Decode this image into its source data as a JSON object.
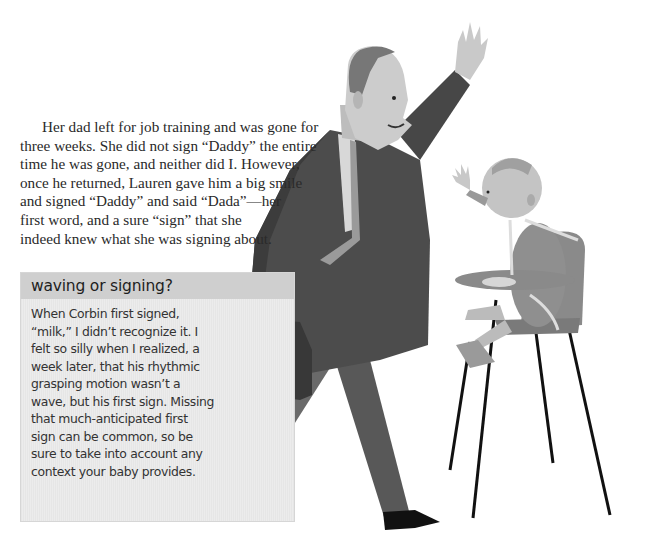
{
  "article": {
    "paragraph_lines": [
      "Her dad left for job training and was gone for",
      "three weeks. She did not sign “Daddy” the entire",
      "time he was gone, and neither did I. However,",
      "once he returned, Lauren gave him a big smile",
      "and signed “Daddy” and said “Dada”—her",
      "first word, and a sure “sign” that she",
      "indeed knew what she was signing about."
    ]
  },
  "sidebar": {
    "title": "waving or signing?",
    "body_lines": [
      "When Corbin first signed,",
      "“milk,” I didn’t recognize it. I",
      "felt so silly when I realized, a",
      "week later, that his rhythmic",
      "grasping motion wasn’t a",
      "wave, but his first sign. Missing",
      "that much-anticipated first",
      "sign can be common, so be",
      "sure to take into account any",
      "context your baby provides."
    ]
  },
  "illustration": {
    "subject": "father-waving-to-baby-in-highchair",
    "colors": {
      "suit": "#4a4a4a",
      "skin": "#cfcfcf",
      "hair": "#7a7a7a",
      "tie": "#9a9a9a",
      "shoes": "#111111",
      "highchair": "#8c8c8c",
      "legs": "#111111"
    }
  }
}
